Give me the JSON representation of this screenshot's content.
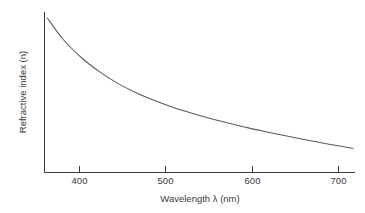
{
  "chart_data": {
    "type": "line",
    "title": "",
    "xlabel": "Wavelength λ (nm)",
    "ylabel": "Refractive index (n)",
    "xlim": [
      380,
      715
    ],
    "ylim": [
      0,
      1
    ],
    "xticks": [
      400,
      500,
      600,
      700
    ],
    "xtick_labels": [
      "400",
      "500",
      "600",
      "700"
    ],
    "yticks": [],
    "ytick_labels": [],
    "grid": false,
    "legend": false,
    "series": [
      {
        "name": "Refractive index",
        "color": "#5a5a5a",
        "x": [
          383,
          400,
          420,
          440,
          460,
          480,
          500,
          520,
          540,
          560,
          580,
          600,
          620,
          640,
          660,
          680,
          700,
          713
        ],
        "y": [
          0.963,
          0.83,
          0.715,
          0.625,
          0.552,
          0.494,
          0.446,
          0.404,
          0.368,
          0.335,
          0.306,
          0.278,
          0.253,
          0.229,
          0.206,
          0.184,
          0.163,
          0.15
        ]
      }
    ]
  },
  "axes": {
    "x_axis_label": "Wavelength λ (nm)",
    "y_axis_label": "Refractive index (n)",
    "x_tick_400": "400",
    "x_tick_500": "500",
    "x_tick_600": "600",
    "x_tick_700": "700"
  },
  "colors": {
    "curve": "#5a5a5a",
    "axis": "#3c3c3c",
    "text": "#3a3a3a",
    "background": "#ffffff"
  }
}
